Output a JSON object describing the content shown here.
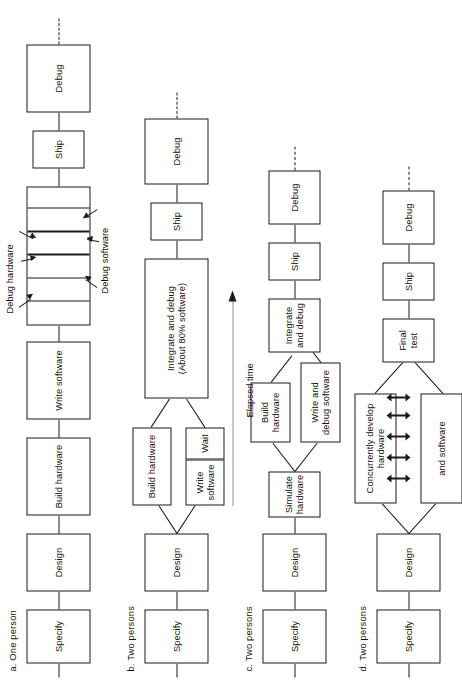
{
  "figure": {
    "timeline": {
      "label": "Elapsed time"
    },
    "diagrams": [
      {
        "key": "a",
        "caption": "a. One person",
        "nodes": [
          {
            "name": "specify",
            "label": "Specify"
          },
          {
            "name": "design",
            "label": "Design"
          },
          {
            "name": "build-hardware",
            "label": "Build hardware"
          },
          {
            "name": "write-software",
            "label": "Write software"
          },
          {
            "name": "ship",
            "label": "Ship"
          },
          {
            "name": "debug",
            "label": "Debug"
          }
        ],
        "debug_stack": {
          "segments": 6,
          "annotations": [
            {
              "name": "debug-hardware-annotation",
              "label": "Debug hardware"
            },
            {
              "name": "debug-software-annotation",
              "label": "Debug software"
            }
          ]
        }
      },
      {
        "key": "b",
        "caption": "b. Two persons",
        "nodes": [
          {
            "name": "specify",
            "label": "Specify"
          },
          {
            "name": "design",
            "label": "Design"
          },
          {
            "name": "build-hardware",
            "label": "Build hardware"
          },
          {
            "name": "write-software",
            "label": "Write\nsoftware"
          },
          {
            "name": "wait",
            "label": "Wait"
          },
          {
            "name": "integrate-and-debug",
            "label": "Integrate and debug\n(About 80% software)"
          },
          {
            "name": "ship",
            "label": "Ship"
          },
          {
            "name": "debug",
            "label": "Debug"
          }
        ]
      },
      {
        "key": "c",
        "caption": "c. Two persons",
        "nodes": [
          {
            "name": "specify",
            "label": "Specify"
          },
          {
            "name": "design",
            "label": "Design"
          },
          {
            "name": "simulate-hardware",
            "label": "Simulate\nhardware"
          },
          {
            "name": "build-hardware",
            "label": "Build\nhardware"
          },
          {
            "name": "write-and-debug-software",
            "label": "Write and\ndebug software"
          },
          {
            "name": "integrate-and-debug",
            "label": "Integrate\nand debug"
          },
          {
            "name": "ship",
            "label": "Ship"
          },
          {
            "name": "debug",
            "label": "Debug"
          }
        ]
      },
      {
        "key": "d",
        "caption": "d. Two persons",
        "nodes": [
          {
            "name": "specify",
            "label": "Specify"
          },
          {
            "name": "design",
            "label": "Design"
          },
          {
            "name": "concurrent-hardware",
            "label": "Concurrently develop\nhardware"
          },
          {
            "name": "concurrent-software",
            "label": "and software"
          },
          {
            "name": "final-test",
            "label": "Final\ntest"
          },
          {
            "name": "ship",
            "label": "Ship"
          },
          {
            "name": "debug",
            "label": "Debug"
          }
        ],
        "sync_arrows": 5
      }
    ]
  },
  "colors": {
    "ink": "#1a1a1a",
    "paper": "#ffffff"
  }
}
